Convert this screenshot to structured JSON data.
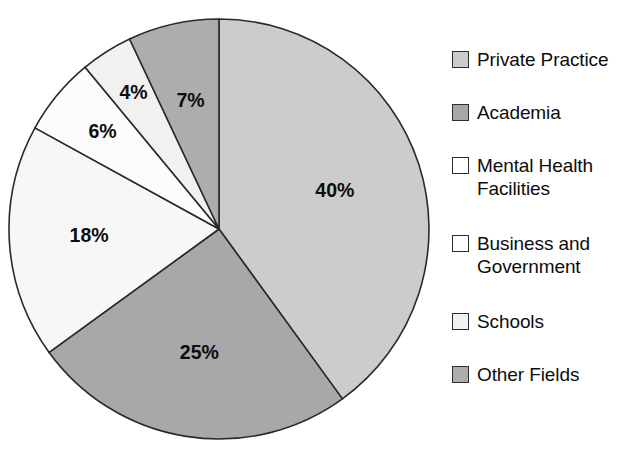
{
  "chart_data": {
    "type": "pie",
    "title": "",
    "subtitle": "",
    "xlabel": "",
    "ylabel": "",
    "legend_position": "right",
    "grid": false,
    "start_angle_deg": 0,
    "direction": "clockwise",
    "categories": [
      "Private Practice",
      "Academia",
      "Mental Health Facilities",
      "Business and Government",
      "Schools",
      "Other Fields"
    ],
    "values": [
      40,
      25,
      18,
      6,
      4,
      7
    ],
    "data_labels": [
      "40%",
      "25%",
      "18%",
      "6%",
      "4%",
      "7%"
    ],
    "colors": [
      "#cccccc",
      "#a8a8a8",
      "#f7f7f7",
      "#fcfcfc",
      "#f1f1f1",
      "#adadad"
    ],
    "slices": [
      {
        "label": "Private Practice",
        "value": 40,
        "display": "40%",
        "color": "#cccccc"
      },
      {
        "label": "Academia",
        "value": 25,
        "display": "25%",
        "color": "#a8a8a8"
      },
      {
        "label": "Mental Health Facilities",
        "value": 18,
        "display": "18%",
        "color": "#f7f7f7"
      },
      {
        "label": "Business and Government",
        "value": 6,
        "display": "6%",
        "color": "#fcfcfc"
      },
      {
        "label": "Schools",
        "value": 4,
        "display": "4%",
        "color": "#f1f1f1"
      },
      {
        "label": "Other Fields",
        "value": 7,
        "display": "7%",
        "color": "#adadad"
      }
    ]
  },
  "legend": {
    "items": [
      {
        "label": "Private Practice",
        "color": "#cccccc"
      },
      {
        "label": "Academia",
        "color": "#a8a8a8"
      },
      {
        "label": "Mental Health\nFacilities",
        "color": "#ffffff"
      },
      {
        "label": "Business and\nGovernment",
        "color": "#fdfdfd"
      },
      {
        "label": "Schools",
        "color": "#f1f1f1"
      },
      {
        "label": "Other Fields",
        "color": "#adadad"
      }
    ]
  }
}
